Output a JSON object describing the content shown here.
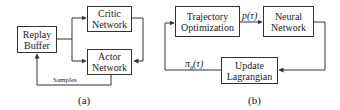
{
  "diagram_a": {
    "caption": "(a)",
    "nodes": {
      "replay_buffer": {
        "line1": "Replay",
        "line2": "Buffer"
      },
      "critic_network": {
        "line1": "Critic",
        "line2": "Network"
      },
      "actor_network": {
        "line1": "Actor",
        "line2": "Network"
      }
    },
    "edges": [
      {
        "from": "replay_buffer",
        "to": "critic_network",
        "label": ""
      },
      {
        "from": "replay_buffer",
        "to": "actor_network",
        "label": ""
      },
      {
        "from": "critic_network",
        "to": "actor_network",
        "label": ""
      },
      {
        "from": "actor_network",
        "to": "replay_buffer",
        "label": "Samples"
      }
    ],
    "samples_label": "Samples"
  },
  "diagram_b": {
    "caption": "(b)",
    "nodes": {
      "trajectory_optimization": {
        "line1": "Trajectory",
        "line2": "Optimization"
      },
      "neural_network": {
        "line1": "Neural",
        "line2": "Network"
      },
      "update_lagrangian": {
        "line1": "Update",
        "line2": "Lagrangian"
      }
    },
    "edges": [
      {
        "from": "trajectory_optimization",
        "to": "neural_network",
        "label": "p(τ)"
      },
      {
        "from": "neural_network",
        "to": "update_lagrangian",
        "label": ""
      },
      {
        "from": "update_lagrangian",
        "to": "trajectory_optimization",
        "label": "πθ(τ)"
      }
    ],
    "p_tau_label": "p(τ)",
    "pi_theta_label": "πθ(τ)",
    "pi_symbol": "π",
    "theta_sub": "θ",
    "tau_arg": "(τ)"
  },
  "colors": {
    "line": "#333333",
    "text": "#1a1a1a",
    "background": "#ffffff"
  }
}
